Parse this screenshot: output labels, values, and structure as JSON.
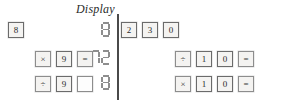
{
  "figure": {
    "type": "calculator-keystroke-exercise",
    "panel_count": 2
  },
  "labels": {
    "display_left": "Display",
    "display_right": "Display"
  },
  "colors": {
    "key_border": "#8d8d8d",
    "key_fill": "#f4f3f1",
    "segment": "#8e8e8e",
    "divider": "#4a4a4a",
    "text": "#2b2b2b"
  },
  "panels": [
    {
      "id": "left",
      "display_label": "Display",
      "rows": [
        {
          "id": "left-row-1",
          "keys": [
            {
              "label": "8",
              "kind": "digit",
              "name": "key-8"
            }
          ],
          "display": "8"
        },
        {
          "id": "left-row-2",
          "keys": [
            {
              "label": "×",
              "kind": "op",
              "name": "key-multiply"
            },
            {
              "label": "9",
              "kind": "digit",
              "name": "key-9"
            },
            {
              "label": "=",
              "kind": "op",
              "name": "key-equals"
            }
          ],
          "display": "72"
        },
        {
          "id": "left-row-3",
          "keys": [
            {
              "label": "÷",
              "kind": "op",
              "name": "key-divide"
            },
            {
              "label": "9",
              "kind": "digit",
              "name": "key-9"
            },
            {
              "label": "",
              "kind": "blank",
              "name": "key-blank"
            }
          ],
          "display": "8"
        }
      ]
    },
    {
      "id": "right",
      "display_label": "Display",
      "rows": [
        {
          "id": "right-row-1",
          "keys": [
            {
              "label": "2",
              "kind": "digit",
              "name": "key-2"
            },
            {
              "label": "3",
              "kind": "digit",
              "name": "key-3"
            },
            {
              "label": "0",
              "kind": "digit",
              "name": "key-0"
            }
          ],
          "display": "230"
        },
        {
          "id": "right-row-2",
          "keys": [
            {
              "label": "÷",
              "kind": "op",
              "name": "key-divide"
            },
            {
              "label": "1",
              "kind": "digit",
              "name": "key-1"
            },
            {
              "label": "0",
              "kind": "digit",
              "name": "key-0"
            },
            {
              "label": "=",
              "kind": "op",
              "name": "key-equals"
            }
          ],
          "display": "23"
        },
        {
          "id": "right-row-3",
          "keys": [
            {
              "label": "×",
              "kind": "op",
              "name": "key-multiply"
            },
            {
              "label": "1",
              "kind": "digit",
              "name": "key-1"
            },
            {
              "label": "0",
              "kind": "digit",
              "name": "key-0"
            },
            {
              "label": "=",
              "kind": "op",
              "name": "key-equals"
            }
          ],
          "display": "230"
        }
      ]
    }
  ]
}
